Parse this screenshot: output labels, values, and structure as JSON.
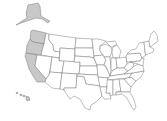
{
  "map": {
    "title": "United States map",
    "highlight_color": "#c8c8c8",
    "base_color": "#ffffff",
    "border_color": "#7a7a7a",
    "highlighted_states": [
      "Alaska",
      "Hawaii",
      "Washington",
      "Oregon",
      "California"
    ],
    "states": [
      {
        "id": "AK",
        "name": "Alaska",
        "highlighted": true
      },
      {
        "id": "HI",
        "name": "Hawaii",
        "highlighted": true
      },
      {
        "id": "WA",
        "name": "Washington",
        "highlighted": true
      },
      {
        "id": "OR",
        "name": "Oregon",
        "highlighted": true
      },
      {
        "id": "CA",
        "name": "California",
        "highlighted": true
      },
      {
        "id": "ID",
        "name": "Idaho",
        "highlighted": false
      },
      {
        "id": "NV",
        "name": "Nevada",
        "highlighted": false
      },
      {
        "id": "MT",
        "name": "Montana",
        "highlighted": false
      },
      {
        "id": "WY",
        "name": "Wyoming",
        "highlighted": false
      },
      {
        "id": "UT",
        "name": "Utah",
        "highlighted": false
      },
      {
        "id": "AZ",
        "name": "Arizona",
        "highlighted": false
      },
      {
        "id": "CO",
        "name": "Colorado",
        "highlighted": false
      },
      {
        "id": "NM",
        "name": "New Mexico",
        "highlighted": false
      },
      {
        "id": "ND",
        "name": "North Dakota",
        "highlighted": false
      },
      {
        "id": "SD",
        "name": "South Dakota",
        "highlighted": false
      },
      {
        "id": "NE",
        "name": "Nebraska",
        "highlighted": false
      },
      {
        "id": "KS",
        "name": "Kansas",
        "highlighted": false
      },
      {
        "id": "OK",
        "name": "Oklahoma",
        "highlighted": false
      },
      {
        "id": "TX",
        "name": "Texas",
        "highlighted": false
      },
      {
        "id": "MN",
        "name": "Minnesota",
        "highlighted": false
      },
      {
        "id": "IA",
        "name": "Iowa",
        "highlighted": false
      },
      {
        "id": "MO",
        "name": "Missouri",
        "highlighted": false
      },
      {
        "id": "AR",
        "name": "Arkansas",
        "highlighted": false
      },
      {
        "id": "LA",
        "name": "Louisiana",
        "highlighted": false
      },
      {
        "id": "WI",
        "name": "Wisconsin",
        "highlighted": false
      },
      {
        "id": "IL",
        "name": "Illinois",
        "highlighted": false
      },
      {
        "id": "MI",
        "name": "Michigan",
        "highlighted": false
      },
      {
        "id": "IN",
        "name": "Indiana",
        "highlighted": false
      },
      {
        "id": "OH",
        "name": "Ohio",
        "highlighted": false
      },
      {
        "id": "KY",
        "name": "Kentucky",
        "highlighted": false
      },
      {
        "id": "TN",
        "name": "Tennessee",
        "highlighted": false
      },
      {
        "id": "MS",
        "name": "Mississippi",
        "highlighted": false
      },
      {
        "id": "AL",
        "name": "Alabama",
        "highlighted": false
      },
      {
        "id": "GA",
        "name": "Georgia",
        "highlighted": false
      },
      {
        "id": "FL",
        "name": "Florida",
        "highlighted": false
      },
      {
        "id": "SC",
        "name": "South Carolina",
        "highlighted": false
      },
      {
        "id": "NC",
        "name": "North Carolina",
        "highlighted": false
      },
      {
        "id": "VA",
        "name": "Virginia",
        "highlighted": false
      },
      {
        "id": "WV",
        "name": "West Virginia",
        "highlighted": false
      },
      {
        "id": "PA",
        "name": "Pennsylvania",
        "highlighted": false
      },
      {
        "id": "NY",
        "name": "New York",
        "highlighted": false
      },
      {
        "id": "ME",
        "name": "Maine",
        "highlighted": false
      },
      {
        "id": "NE_STATES",
        "name": "New England",
        "highlighted": false
      }
    ]
  }
}
